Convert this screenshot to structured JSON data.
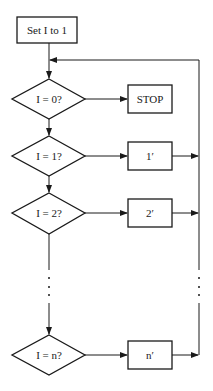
{
  "diagram": {
    "type": "flowchart",
    "colors": {
      "stroke": "#1a1a1a",
      "fill": "#ffffff",
      "background": "#ffffff"
    },
    "start": {
      "label": "Set I to 1"
    },
    "decisions": [
      {
        "label": "I = 0?"
      },
      {
        "label": "I = 1?"
      },
      {
        "label": "I = 2?"
      },
      {
        "label": "I = n?"
      }
    ],
    "actions": [
      {
        "label": "STOP"
      },
      {
        "label": "1′"
      },
      {
        "label": "2′"
      },
      {
        "label": "n′"
      }
    ],
    "ellipsis": "⋮"
  }
}
